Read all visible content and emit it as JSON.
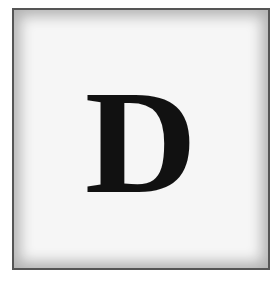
{
  "tile": {
    "letter": "D",
    "colors": {
      "background": "#f6f6f6",
      "border": "#555555",
      "letter": "#111111"
    }
  }
}
